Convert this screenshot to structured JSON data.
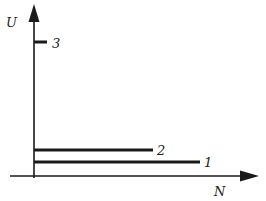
{
  "diagram": {
    "axes": {
      "y_label": "U",
      "x_label": "N"
    },
    "lines": [
      {
        "label": "1",
        "description": "long horizontal line, lowest"
      },
      {
        "label": "2",
        "description": "medium horizontal line, just above line 1"
      },
      {
        "label": "3",
        "description": "short tick near top of U axis"
      }
    ],
    "colors": {
      "ink": "#1a1a1a",
      "background": "#ffffff"
    }
  }
}
